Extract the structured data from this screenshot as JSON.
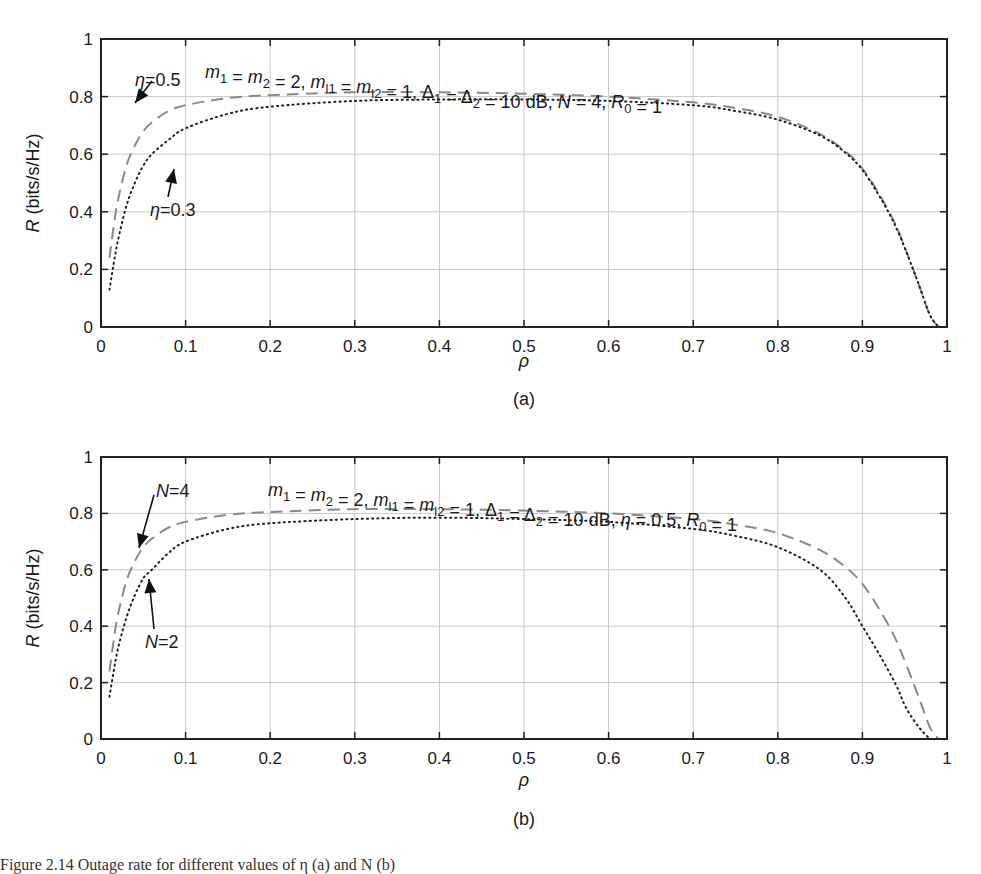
{
  "chart_data": [
    {
      "id": "a",
      "type": "line",
      "subfigure_label": "(a)",
      "title": "",
      "annotation": "m1 = m2 = 2, ml1 = ml2 = 1, Δ1 = Δ2 = 10 dB, N = 4, R0 = 1",
      "xlabel": "ρ",
      "ylabel": "R (bits/s/Hz)",
      "xlim": [
        0,
        1
      ],
      "ylim": [
        0,
        1
      ],
      "xticks": [
        "0",
        "0.1",
        "0.2",
        "0.3",
        "0.4",
        "0.5",
        "0.6",
        "0.7",
        "0.8",
        "0.9",
        "1"
      ],
      "yticks": [
        "0",
        "0.2",
        "0.4",
        "0.6",
        "0.8",
        "1"
      ],
      "grid": true,
      "legend": "none (inline arrow annotations)",
      "series": [
        {
          "name": "η = 0.5",
          "style": "dashed-gray",
          "x": [
            0.01,
            0.015,
            0.02,
            0.03,
            0.04,
            0.05,
            0.06,
            0.08,
            0.1,
            0.15,
            0.2,
            0.3,
            0.4,
            0.5,
            0.6,
            0.7,
            0.75,
            0.8,
            0.85,
            0.88,
            0.9,
            0.92,
            0.94,
            0.96,
            0.97,
            0.98,
            0.99
          ],
          "values": [
            0.24,
            0.35,
            0.44,
            0.56,
            0.63,
            0.68,
            0.71,
            0.75,
            0.77,
            0.795,
            0.805,
            0.815,
            0.815,
            0.81,
            0.8,
            0.78,
            0.76,
            0.73,
            0.67,
            0.61,
            0.55,
            0.46,
            0.35,
            0.2,
            0.12,
            0.04,
            0.0
          ]
        },
        {
          "name": "η = 0.3",
          "style": "dotted-black",
          "x": [
            0.01,
            0.015,
            0.02,
            0.03,
            0.04,
            0.05,
            0.06,
            0.08,
            0.1,
            0.15,
            0.2,
            0.3,
            0.4,
            0.5,
            0.6,
            0.7,
            0.75,
            0.8,
            0.85,
            0.88,
            0.9,
            0.92,
            0.94,
            0.96,
            0.97,
            0.98,
            0.99
          ],
          "values": [
            0.13,
            0.22,
            0.3,
            0.42,
            0.5,
            0.56,
            0.6,
            0.65,
            0.69,
            0.74,
            0.765,
            0.785,
            0.79,
            0.79,
            0.785,
            0.77,
            0.75,
            0.72,
            0.665,
            0.605,
            0.545,
            0.455,
            0.345,
            0.2,
            0.12,
            0.04,
            0.0
          ]
        }
      ],
      "annotations": [
        {
          "text": "η = 0.5",
          "points_to": [
            0.03,
            0.66
          ]
        },
        {
          "text": "η = 0.3",
          "points_to": [
            0.09,
            0.64
          ]
        }
      ]
    },
    {
      "id": "b",
      "type": "line",
      "subfigure_label": "(b)",
      "title": "",
      "annotation": "m1 = m2 = 2, ml1 = ml2 = 1, Δ1 = Δ2 = 10 dB, η = 0.5, R0 = 1",
      "xlabel": "ρ",
      "ylabel": "R (bits/s/Hz)",
      "xlim": [
        0,
        1
      ],
      "ylim": [
        0,
        1
      ],
      "xticks": [
        "0",
        "0.1",
        "0.2",
        "0.3",
        "0.4",
        "0.5",
        "0.6",
        "0.7",
        "0.8",
        "0.9",
        "1"
      ],
      "yticks": [
        "0",
        "0.2",
        "0.4",
        "0.6",
        "0.8",
        "1"
      ],
      "grid": true,
      "legend": "none (inline arrow annotations)",
      "series": [
        {
          "name": "N = 4",
          "style": "dashed-gray",
          "x": [
            0.01,
            0.015,
            0.02,
            0.03,
            0.04,
            0.05,
            0.06,
            0.08,
            0.1,
            0.15,
            0.2,
            0.3,
            0.4,
            0.5,
            0.6,
            0.7,
            0.75,
            0.8,
            0.85,
            0.88,
            0.9,
            0.92,
            0.94,
            0.96,
            0.97,
            0.98,
            0.99
          ],
          "values": [
            0.24,
            0.35,
            0.44,
            0.56,
            0.63,
            0.68,
            0.71,
            0.75,
            0.77,
            0.795,
            0.805,
            0.815,
            0.815,
            0.81,
            0.8,
            0.78,
            0.76,
            0.73,
            0.67,
            0.61,
            0.55,
            0.46,
            0.35,
            0.2,
            0.12,
            0.04,
            0.0
          ]
        },
        {
          "name": "N = 2",
          "style": "dotted-black",
          "x": [
            0.01,
            0.015,
            0.02,
            0.03,
            0.04,
            0.05,
            0.06,
            0.08,
            0.1,
            0.15,
            0.2,
            0.3,
            0.4,
            0.5,
            0.6,
            0.7,
            0.75,
            0.8,
            0.85,
            0.88,
            0.9,
            0.92,
            0.94,
            0.95,
            0.96,
            0.97,
            0.98
          ],
          "values": [
            0.15,
            0.24,
            0.32,
            0.43,
            0.51,
            0.57,
            0.6,
            0.66,
            0.7,
            0.745,
            0.765,
            0.78,
            0.785,
            0.78,
            0.77,
            0.745,
            0.72,
            0.68,
            0.6,
            0.5,
            0.4,
            0.3,
            0.19,
            0.12,
            0.07,
            0.03,
            0.0
          ]
        }
      ],
      "annotations": [
        {
          "text": "N = 4",
          "points_to": [
            0.03,
            0.64
          ]
        },
        {
          "text": "N = 2",
          "points_to": [
            0.055,
            0.59
          ]
        }
      ]
    }
  ],
  "figure": {
    "panel_a_label": "(a)",
    "panel_b_label": "(b)",
    "caption_partial": "Figure 2.14  Outage rate for different values of η (a) and N (b)"
  }
}
